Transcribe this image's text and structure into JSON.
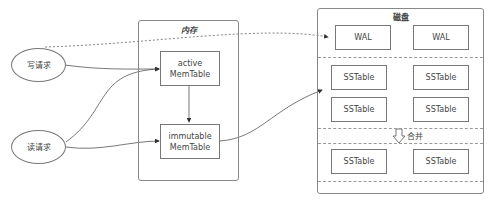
{
  "diagram": {
    "requests": {
      "write": "写请求",
      "read": "读请求"
    },
    "memory": {
      "title": "内存",
      "active": [
        "active",
        "MemTable"
      ],
      "immutable": [
        "immutable",
        "MemTable"
      ]
    },
    "disk": {
      "title": "磁盘",
      "wal": [
        "WAL",
        "WAL"
      ],
      "sstable_level0": [
        "SSTable",
        "SSTable",
        "SSTable",
        "SSTable"
      ],
      "merge_label": "合并",
      "sstable_level1": [
        "SSTable",
        "SSTable"
      ]
    },
    "colors": {
      "stroke": "#777777",
      "text": "#444444",
      "background": "#ffffff"
    }
  }
}
